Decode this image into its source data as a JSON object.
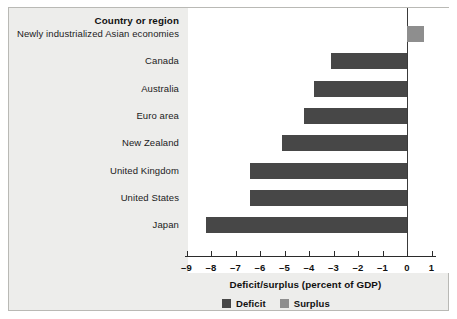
{
  "chart_data": {
    "type": "bar",
    "orientation": "horizontal",
    "title": "",
    "xlabel": "Deficit/surplus (percent of GDP)",
    "ylabel": "Country or region",
    "categories": [
      "Newly industrialized Asian economies",
      "Canada",
      "Australia",
      "Euro area",
      "New Zealand",
      "United Kingdom",
      "United States",
      "Japan"
    ],
    "values": [
      0.7,
      -3.1,
      -3.8,
      -4.2,
      -5.1,
      -6.4,
      -6.4,
      -8.2
    ],
    "bar_kinds": [
      "surplus",
      "deficit",
      "deficit",
      "deficit",
      "deficit",
      "deficit",
      "deficit",
      "deficit"
    ],
    "xlim": [
      -9,
      1
    ],
    "xticks": [
      -9,
      -8,
      -7,
      -6,
      -5,
      -4,
      -3,
      -2,
      -1,
      0,
      1
    ],
    "xtick_labels": [
      "–9",
      "–8",
      "–7",
      "–6",
      "–5",
      "–4",
      "–3",
      "–2",
      "–1",
      "0",
      "1"
    ],
    "grid": false,
    "legend_position": "bottom-center",
    "legend": [
      {
        "label": "Deficit",
        "color": "#474747"
      },
      {
        "label": "Surplus",
        "color": "#8e8e8e"
      }
    ]
  },
  "axes": {
    "category_header": "Country or region",
    "value_title": "Deficit/surplus (percent of GDP)"
  },
  "colors": {
    "deficit": "#474747",
    "surplus": "#8e8e8e",
    "panel_background": "#ededeb",
    "plot_background": "#ffffff",
    "axis": "#2b2b2b"
  }
}
